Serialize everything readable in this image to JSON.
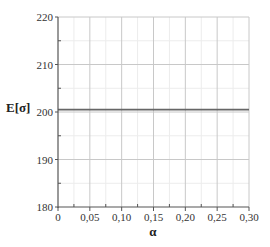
{
  "chart_data": {
    "type": "line",
    "title": "",
    "xlabel": "α",
    "ylabel": "E[σ]",
    "xlim": [
      0,
      0.3
    ],
    "ylim": [
      180,
      220
    ],
    "x_ticks": [
      "0",
      "0,05",
      "0,10",
      "0,15",
      "0,20",
      "0,25",
      "0,30"
    ],
    "x_tick_values": [
      0,
      0.05,
      0.1,
      0.15,
      0.2,
      0.25,
      0.3
    ],
    "y_ticks": [
      "180",
      "190",
      "200",
      "210",
      "220"
    ],
    "y_tick_values": [
      180,
      190,
      200,
      210,
      220
    ],
    "grid": true,
    "legend": null,
    "series": [
      {
        "name": "E[σ]",
        "color": "#666666",
        "x": [
          0,
          0.3
        ],
        "values": [
          200.5,
          200.5
        ]
      }
    ]
  },
  "colors": {
    "axis": "#555555",
    "grid_major": "#c8c8c8",
    "grid_minor": "#ececec",
    "series_line": "#666666"
  }
}
